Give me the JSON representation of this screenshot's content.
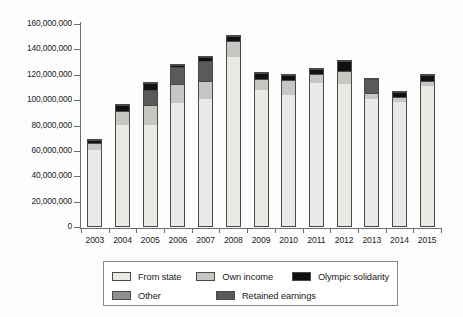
{
  "chart_data": {
    "type": "bar",
    "subtype": "stacked",
    "title": "",
    "xlabel": "",
    "ylabel": "",
    "ylim": [
      0,
      160000000
    ],
    "ytick_step": 20000000,
    "ytick_labels": [
      "0",
      "20,000,000",
      "40,000,000",
      "60,000,000",
      "80,000,000",
      "100,000,000",
      "120,000,000",
      "140,000,000",
      "160,000,000"
    ],
    "ytick_values": [
      0,
      20000000,
      40000000,
      60000000,
      80000000,
      100000000,
      120000000,
      140000000,
      160000000
    ],
    "grid": false,
    "legend_position": "bottom",
    "categories": [
      "2003",
      "2004",
      "2005",
      "2006",
      "2007",
      "2008",
      "2009",
      "2010",
      "2011",
      "2012",
      "2013",
      "2014",
      "2015"
    ],
    "stack_order_bottom_to_top": [
      "From state",
      "Own income",
      "Other",
      "Retained earnings",
      "Olympic solidarity"
    ],
    "series": [
      {
        "name": "From state",
        "color": "#e9e9e6",
        "values": [
          60000000,
          80000000,
          80000000,
          97000000,
          100000000,
          133000000,
          107000000,
          103000000,
          113000000,
          112000000,
          100000000,
          98000000,
          110000000
        ]
      },
      {
        "name": "Own income",
        "color": "#c6c6c2",
        "values": [
          5500000,
          11000000,
          15000000,
          15000000,
          14000000,
          13000000,
          9000000,
          12000000,
          7000000,
          10000000,
          5000000,
          4000000,
          4000000
        ]
      },
      {
        "name": "Other",
        "color": "#8f8f8c",
        "values": [
          0,
          0,
          0,
          0,
          0,
          0,
          0,
          0,
          0,
          0,
          0,
          0,
          0
        ]
      },
      {
        "name": "Retained earnings",
        "color": "#5a5a58",
        "values": [
          0,
          0,
          12000000,
          13000000,
          16000000,
          0,
          0,
          0,
          0,
          0,
          11000000,
          0,
          0
        ]
      },
      {
        "name": "Olympic solidarity",
        "color": "#111111",
        "values": [
          2500000,
          4000000,
          6000000,
          2000000,
          3000000,
          4000000,
          5000000,
          4000000,
          4000000,
          8000000,
          0,
          4000000,
          5000000
        ]
      }
    ],
    "totals": [
      68000000,
      95000000,
      113000000,
      127000000,
      133000000,
      150000000,
      121000000,
      119000000,
      124000000,
      130000000,
      116000000,
      106000000,
      119000000
    ]
  },
  "legend": {
    "items": [
      {
        "label": "From state",
        "color": "#e9e9e6"
      },
      {
        "label": "Own income",
        "color": "#c6c6c2"
      },
      {
        "label": "Olympic solidarity",
        "color": "#111111"
      },
      {
        "label": "Other",
        "color": "#8f8f8c"
      },
      {
        "label": "Retained earnings",
        "color": "#5a5a58"
      }
    ]
  }
}
